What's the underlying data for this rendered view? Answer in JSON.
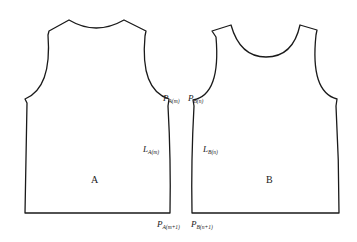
{
  "figure": {
    "pieces": [
      {
        "name": "A",
        "label": "A",
        "points": {
          "P_top": {
            "main": "P",
            "sub": "A(m)"
          },
          "L_side": {
            "main": "L",
            "sub": "A(m)"
          },
          "P_bottom": {
            "main": "P",
            "sub": "A(m+1)"
          }
        }
      },
      {
        "name": "B",
        "label": "B",
        "points": {
          "P_top": {
            "main": "P",
            "sub": "B(n)"
          },
          "L_side": {
            "main": "L",
            "sub": "B(n)"
          },
          "P_bottom": {
            "main": "P",
            "sub": "B(n+1)"
          }
        }
      }
    ],
    "colors": {
      "stroke": "#1a1a1a",
      "background": "#ffffff"
    }
  }
}
